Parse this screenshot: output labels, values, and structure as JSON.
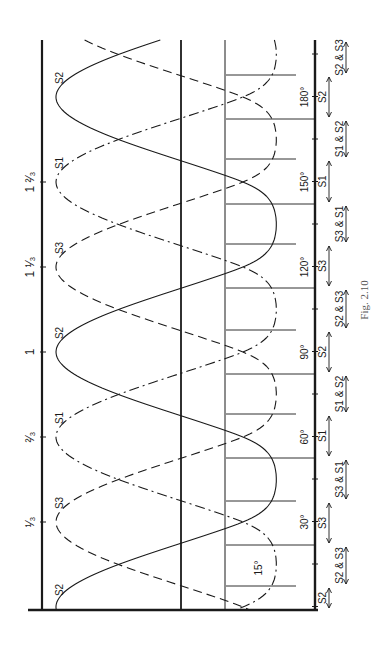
{
  "figure": {
    "caption": "Fig. 2.10",
    "orientation": "rotated 90° counter-clockwise",
    "colors": {
      "ink": "#1a1a1a",
      "caption": "#555555",
      "background": "#ffffff"
    }
  },
  "top_axis": {
    "ticks": [
      {
        "label": "1/3",
        "y": 522
      },
      {
        "label": "2/3",
        "y": 437
      },
      {
        "label": "1",
        "y": 352
      },
      {
        "label": "1 1/3",
        "y": 267
      },
      {
        "label": "1 2/3",
        "y": 182
      }
    ]
  },
  "angle_axis": {
    "ticks": [
      {
        "label": "30°",
        "y": 522
      },
      {
        "label": "60°",
        "y": 437
      },
      {
        "label": "90°",
        "y": 352
      },
      {
        "label": "120°",
        "y": 267
      },
      {
        "label": "150°",
        "y": 182
      },
      {
        "label": "180°",
        "y": 97
      }
    ],
    "inner_label": "15°"
  },
  "curves": [
    {
      "name": "S2",
      "style": "solid",
      "peaks_y": [
        97,
        352,
        607
      ],
      "label_positions": [
        [
          56,
          78
        ],
        [
          56,
          333
        ],
        [
          56,
          590
        ]
      ]
    },
    {
      "name": "S1",
      "style": "dash-dot",
      "peaks_y": [
        182,
        437
      ],
      "label_positions": [
        [
          56,
          163
        ],
        [
          56,
          418
        ]
      ]
    },
    {
      "name": "S3",
      "style": "dashed",
      "peaks_y": [
        267,
        522
      ],
      "label_positions": [
        [
          56,
          248
        ],
        [
          56,
          503
        ]
      ]
    }
  ],
  "conduction_intervals": [
    {
      "label": "S2",
      "kind": "single"
    },
    {
      "label": "S2 & S3",
      "kind": "pair"
    },
    {
      "label": "S3",
      "kind": "single"
    },
    {
      "label": "S3 & S1",
      "kind": "pair"
    },
    {
      "label": "S1",
      "kind": "single"
    },
    {
      "label": "S1 & S2",
      "kind": "pair"
    },
    {
      "label": "S2",
      "kind": "single"
    },
    {
      "label": "S2 & S3",
      "kind": "pair"
    },
    {
      "label": "S3",
      "kind": "single"
    },
    {
      "label": "S3 & S1",
      "kind": "pair"
    },
    {
      "label": "S1",
      "kind": "single"
    },
    {
      "label": "S1 & S2",
      "kind": "pair"
    },
    {
      "label": "S2",
      "kind": "single"
    },
    {
      "label": "S2 & S3",
      "kind": "pair"
    }
  ],
  "commutation_lines_y": [
    75,
    119,
    159,
    204,
    244,
    288,
    330,
    374,
    414,
    458,
    501,
    545,
    586
  ]
}
